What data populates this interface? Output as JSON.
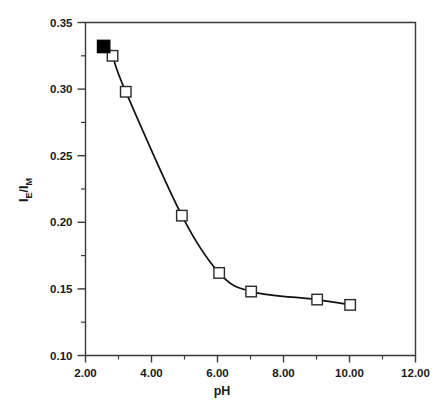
{
  "chart_data": {
    "type": "line",
    "title": "",
    "subtitle": "",
    "xlabel": "pH",
    "ylabel": "IE/IM",
    "ylabel_parts": {
      "lead": "I",
      "lead_sub": "E",
      "slash": "/I",
      "trail_sub": "M"
    },
    "xlim": [
      2.0,
      12.0
    ],
    "ylim": [
      0.1,
      0.35
    ],
    "grid": false,
    "legend": null,
    "x_ticks": [
      2.0,
      4.0,
      6.0,
      8.0,
      10.0,
      12.0
    ],
    "x_tick_labels": [
      "2.00",
      "4.00",
      "6.00",
      "8.00",
      "10.00",
      "12.00"
    ],
    "x_minor_ticks": [
      3.0,
      5.0,
      7.0,
      9.0,
      11.0
    ],
    "y_ticks": [
      0.1,
      0.15,
      0.2,
      0.25,
      0.3,
      0.35
    ],
    "y_tick_labels": [
      "0.10",
      "0.15",
      "0.20",
      "0.25",
      "0.30",
      "0.35"
    ],
    "y_minor_ticks": [
      0.125,
      0.175,
      0.225,
      0.275,
      0.325
    ],
    "series": [
      {
        "name": "open-squares",
        "marker": "open-square",
        "x": [
          2.82,
          3.22,
          4.92,
          6.05,
          7.02,
          9.02,
          10.02
        ],
        "values": [
          0.325,
          0.298,
          0.205,
          0.162,
          0.148,
          0.142,
          0.138
        ]
      },
      {
        "name": "filled-square",
        "marker": "filled-square",
        "x": [
          2.55
        ],
        "values": [
          0.332
        ]
      }
    ],
    "colors": {
      "axis": "#3a3a3a",
      "curve": "#111111",
      "marker_fill_open": "#ffffff",
      "marker_stroke": "#2a2a2a",
      "marker_fill_solid": "#000000",
      "background": "#ffffff"
    }
  }
}
